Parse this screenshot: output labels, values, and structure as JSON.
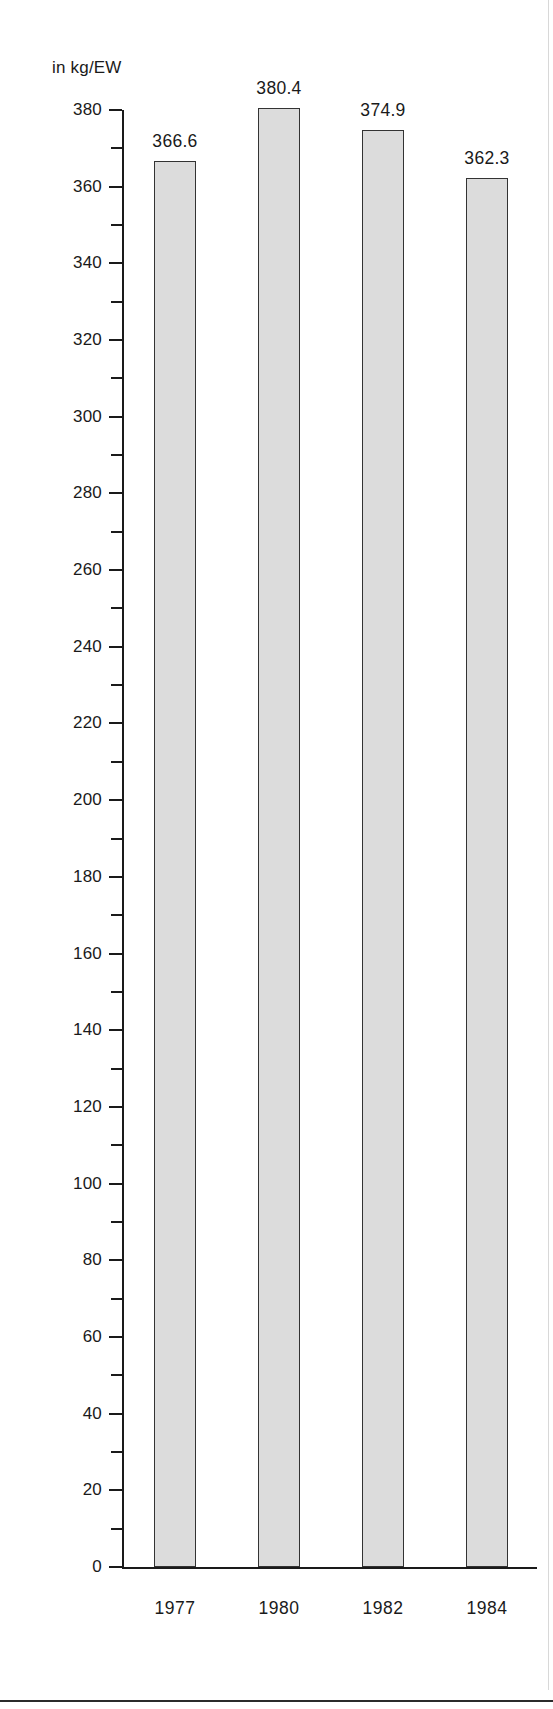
{
  "chart_data": {
    "type": "bar",
    "title": "",
    "subtitle": "",
    "unit_label": "in kg/EW",
    "xlabel": "",
    "ylabel": "in kg/EW",
    "categories": [
      "1977",
      "1980",
      "1982",
      "1984"
    ],
    "values": [
      366.6,
      380.4,
      374.9,
      362.3
    ],
    "value_labels": [
      "366.6",
      "380.4",
      "374.9",
      "362.3"
    ],
    "series": [
      {
        "name": "",
        "values": [
          366.6,
          380.4,
          374.9,
          362.3
        ]
      }
    ],
    "ylim": [
      0,
      380
    ],
    "y_tick_step_major": 20,
    "y_tick_step_minor": 10,
    "y_ticks_major": [
      "380",
      "360",
      "340",
      "320",
      "300",
      "280",
      "260",
      "240",
      "220",
      "200",
      "180",
      "160",
      "140",
      "120",
      "100",
      "80",
      "60",
      "40",
      "20",
      "0"
    ],
    "y_ticks_minor": [
      370,
      350,
      330,
      310,
      290,
      270,
      250,
      230,
      210,
      190,
      170,
      150,
      130,
      110,
      90,
      70,
      50,
      30,
      10
    ],
    "grid": false,
    "legend": null,
    "legend_position": "none",
    "bar_fill_color": "#dcdcdc",
    "bar_border_color": "#333333",
    "axis_color": "#1a1a1a",
    "background_color": "#ffffff"
  }
}
